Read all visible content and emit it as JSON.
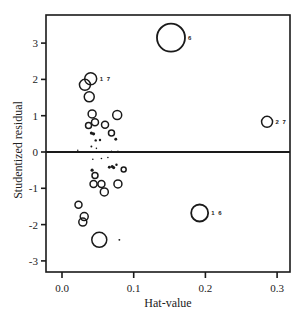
{
  "chart_data": {
    "type": "scatter",
    "title": "",
    "xlabel": "Hat-value",
    "ylabel": "Studentized residual",
    "xlim": [
      -0.023,
      0.318
    ],
    "ylim": [
      -3.35,
      3.75
    ],
    "xticks": [
      0.0,
      0.1,
      0.2,
      0.3
    ],
    "xtick_labels": [
      "0.0",
      "0.1",
      "0.2",
      "0.3"
    ],
    "yticks": [
      -3,
      -2,
      -1,
      0,
      1,
      2,
      3
    ],
    "ytick_labels": [
      "-3",
      "-2",
      "-1",
      "0",
      "1",
      "2",
      "3"
    ],
    "grid": false,
    "reference_line": {
      "y": 0
    },
    "marker": "open circle, area proportional to Cook's distance",
    "points": [
      {
        "h": 0.152,
        "r": 3.15,
        "size": 14,
        "label": "6"
      },
      {
        "h": 0.286,
        "r": 0.83,
        "size": 5.5,
        "label": "27"
      },
      {
        "h": 0.192,
        "r": -1.68,
        "size": 8.5,
        "label": "16"
      },
      {
        "h": 0.04,
        "r": 2.02,
        "size": 6,
        "label": "17"
      },
      {
        "h": 0.032,
        "r": 1.85,
        "size": 5.5,
        "label": ""
      },
      {
        "h": 0.038,
        "r": 1.52,
        "size": 5,
        "label": ""
      },
      {
        "h": 0.042,
        "r": 1.05,
        "size": 4,
        "label": ""
      },
      {
        "h": 0.077,
        "r": 1.02,
        "size": 4.5,
        "label": ""
      },
      {
        "h": 0.037,
        "r": 0.73,
        "size": 3,
        "label": ""
      },
      {
        "h": 0.046,
        "r": 0.82,
        "size": 3.5,
        "label": ""
      },
      {
        "h": 0.06,
        "r": 0.75,
        "size": 3.5,
        "label": ""
      },
      {
        "h": 0.069,
        "r": 0.52,
        "size": 3,
        "label": ""
      },
      {
        "h": 0.041,
        "r": 0.52,
        "size": 2,
        "label": ""
      },
      {
        "h": 0.044,
        "r": 0.5,
        "size": 2,
        "label": ""
      },
      {
        "h": 0.047,
        "r": 0.32,
        "size": 1.5,
        "label": ""
      },
      {
        "h": 0.053,
        "r": 0.33,
        "size": 1.5,
        "label": ""
      },
      {
        "h": 0.075,
        "r": 0.35,
        "size": 1.8,
        "label": ""
      },
      {
        "h": 0.041,
        "r": 0.15,
        "size": 1.2,
        "label": ""
      },
      {
        "h": 0.048,
        "r": 0.1,
        "size": 1,
        "label": ""
      },
      {
        "h": 0.022,
        "r": 0.05,
        "size": 0.8,
        "label": ""
      },
      {
        "h": 0.069,
        "r": 0.02,
        "size": 0.8,
        "label": ""
      },
      {
        "h": 0.078,
        "r": 0.02,
        "size": 0.8,
        "label": ""
      },
      {
        "h": 0.043,
        "r": -0.2,
        "size": 1,
        "label": ""
      },
      {
        "h": 0.055,
        "r": -0.18,
        "size": 1,
        "label": ""
      },
      {
        "h": 0.064,
        "r": -0.15,
        "size": 1,
        "label": ""
      },
      {
        "h": 0.07,
        "r": -0.4,
        "size": 2,
        "label": ""
      },
      {
        "h": 0.072,
        "r": -0.43,
        "size": 2,
        "label": ""
      },
      {
        "h": 0.066,
        "r": -0.42,
        "size": 1.8,
        "label": ""
      },
      {
        "h": 0.076,
        "r": -0.35,
        "size": 1.5,
        "label": ""
      },
      {
        "h": 0.086,
        "r": -0.48,
        "size": 2.5,
        "label": ""
      },
      {
        "h": 0.042,
        "r": -0.5,
        "size": 2,
        "label": ""
      },
      {
        "h": 0.046,
        "r": -0.65,
        "size": 3,
        "label": ""
      },
      {
        "h": 0.044,
        "r": -0.88,
        "size": 3.5,
        "label": ""
      },
      {
        "h": 0.055,
        "r": -0.88,
        "size": 3.5,
        "label": ""
      },
      {
        "h": 0.059,
        "r": -1.1,
        "size": 4,
        "label": ""
      },
      {
        "h": 0.078,
        "r": -0.88,
        "size": 4,
        "label": ""
      },
      {
        "h": 0.023,
        "r": -1.45,
        "size": 3.5,
        "label": ""
      },
      {
        "h": 0.031,
        "r": -1.78,
        "size": 4,
        "label": ""
      },
      {
        "h": 0.029,
        "r": -1.93,
        "size": 4,
        "label": ""
      },
      {
        "h": 0.052,
        "r": -2.42,
        "size": 7.5,
        "label": ""
      },
      {
        "h": 0.08,
        "r": -2.42,
        "size": 1.2,
        "label": ""
      }
    ]
  },
  "axes": {
    "x_title": "Hat-value",
    "y_title": "Studentized residual"
  }
}
